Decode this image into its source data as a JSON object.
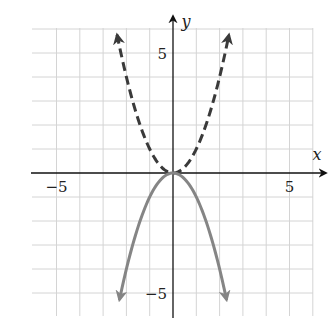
{
  "chart_data": {
    "type": "line",
    "title": "",
    "xlabel": "x",
    "ylabel": "y",
    "xlim": [
      -6,
      6
    ],
    "ylim": [
      -6,
      6
    ],
    "grid": true,
    "grid_step": 1,
    "x_tick_labels": [
      {
        "value": -5,
        "label": "−5"
      },
      {
        "value": 5,
        "label": "5"
      }
    ],
    "y_tick_labels": [
      {
        "value": 5,
        "label": "5"
      },
      {
        "value": -5,
        "label": "−5"
      }
    ],
    "series": [
      {
        "name": "y = x^2",
        "style": "dashed",
        "color": "#3a3a3a",
        "function": "x^2",
        "x_range": [
          -2.4,
          2.4
        ],
        "arrows": "both-ends",
        "points": [
          [
            -2.4,
            5.76
          ],
          [
            -2,
            4
          ],
          [
            -1.5,
            2.25
          ],
          [
            -1,
            1
          ],
          [
            -0.5,
            0.25
          ],
          [
            0,
            0
          ],
          [
            0.5,
            0.25
          ],
          [
            1,
            1
          ],
          [
            1.5,
            2.25
          ],
          [
            2,
            4
          ],
          [
            2.4,
            5.76
          ]
        ]
      },
      {
        "name": "y = -x^2",
        "style": "solid",
        "color": "#858585",
        "function": "-x^2",
        "x_range": [
          -2.3,
          2.3
        ],
        "arrows": "both-ends",
        "points": [
          [
            -2.3,
            -5.29
          ],
          [
            -2,
            -4
          ],
          [
            -1.5,
            -2.25
          ],
          [
            -1,
            -1
          ],
          [
            -0.5,
            -0.25
          ],
          [
            0,
            0
          ],
          [
            0.5,
            -0.25
          ],
          [
            1,
            -1
          ],
          [
            1.5,
            -2.25
          ],
          [
            2,
            -4
          ],
          [
            2.3,
            -5.29
          ]
        ]
      }
    ],
    "colors": {
      "grid": "#d4d4d4",
      "axis": "#111111"
    }
  }
}
